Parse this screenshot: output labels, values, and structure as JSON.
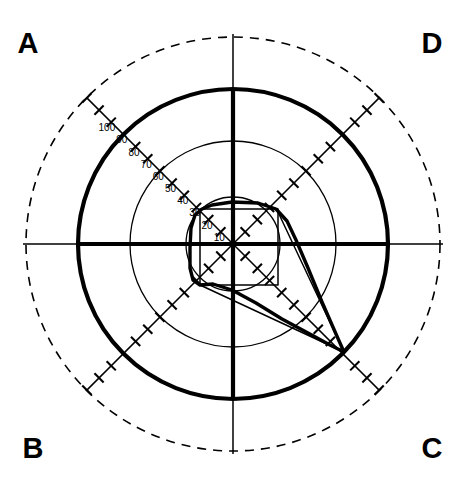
{
  "figure": {
    "type": "goldmann-visual-field-perimetry",
    "background": "#ffffff",
    "ink": "#000000",
    "width": 463,
    "height": 489
  },
  "corner_labels": {
    "top_left": "A",
    "top_right": "D",
    "bottom_left": "B",
    "bottom_right": "C"
  },
  "chart_data": {
    "type": "scatter",
    "title": "",
    "subtitle": "",
    "xlabel": "",
    "ylabel": "",
    "projection": "polar",
    "grid": true,
    "legend_position": "none",
    "center_px": [
      233,
      244
    ],
    "radial_unit": "degrees",
    "degrees_per_pixel": 0.5806,
    "radial_axis": {
      "label": "eccentricity (degrees)",
      "tick_labels": [
        "10",
        "20",
        "30",
        "40",
        "50",
        "60",
        "70",
        "80",
        "90",
        "100"
      ],
      "tick_values": [
        10,
        20,
        30,
        40,
        50,
        60,
        70,
        80,
        90,
        100
      ],
      "tick_label_meridian_deg": 135,
      "tick_spacing_deg": 10,
      "max_tick_deg": 120,
      "rlim": [
        0,
        120
      ]
    },
    "grid_circles": [
      {
        "name": "inner-circle",
        "deg": 27,
        "radius_px": 47,
        "style": "thin-solid",
        "stroke_width": 1.3
      },
      {
        "name": "middle-circle",
        "deg": 60,
        "radius_px": 103,
        "style": "thin-solid",
        "stroke_width": 1.3
      },
      {
        "name": "isopter-boundary-circle",
        "deg": 90,
        "radius_px": 155,
        "style": "thick-solid",
        "stroke_width": 4.2
      },
      {
        "name": "outer-dashed-circle",
        "deg": 120,
        "radius_px": 207,
        "style": "dashed",
        "stroke_width": 1.6
      }
    ],
    "meridians": [
      {
        "name": "horizontal-meridian",
        "angle_deg": 0,
        "style": "axis"
      },
      {
        "name": "vertical-meridian",
        "angle_deg": 90,
        "style": "axis"
      },
      {
        "name": "oblique-meridian-45",
        "angle_deg": 45,
        "style": "ticked"
      },
      {
        "name": "oblique-meridian-135",
        "angle_deg": 135,
        "style": "ticked"
      },
      {
        "name": "oblique-meridian-225",
        "angle_deg": 225,
        "style": "ticked"
      },
      {
        "name": "oblique-meridian-315",
        "angle_deg": 315,
        "style": "ticked"
      }
    ],
    "series": [
      {
        "name": "isopter-trace",
        "style": "thick-solid",
        "stroke_width": 3.4,
        "closed": true,
        "points_px": [
          [
            202,
            209
          ],
          [
            212,
            205
          ],
          [
            232,
            202
          ],
          [
            258,
            203
          ],
          [
            276,
            209
          ],
          [
            287,
            221
          ],
          [
            296,
            240
          ],
          [
            308,
            268
          ],
          [
            322,
            302
          ],
          [
            336,
            334
          ],
          [
            344,
            352
          ],
          [
            330,
            345
          ],
          [
            308,
            333
          ],
          [
            282,
            319
          ],
          [
            256,
            303
          ],
          [
            232,
            290
          ],
          [
            213,
            284
          ],
          [
            200,
            285
          ],
          [
            193,
            280
          ],
          [
            190,
            268
          ],
          [
            190,
            248
          ],
          [
            191,
            228
          ],
          [
            195,
            215
          ]
        ]
      },
      {
        "name": "vector-upper",
        "style": "thin-solid",
        "stroke_width": 1.5,
        "closed": false,
        "points_px": [
          [
            344,
            352
          ],
          [
            278,
            212
          ]
        ]
      },
      {
        "name": "vector-lower",
        "style": "thin-solid",
        "stroke_width": 1.5,
        "closed": false,
        "points_px": [
          [
            344,
            352
          ],
          [
            200,
            285
          ]
        ]
      },
      {
        "name": "scotoma-outline",
        "style": "thin-solid",
        "stroke_width": 1.5,
        "closed": true,
        "points_px": [
          [
            200,
            209
          ],
          [
            278,
            209
          ],
          [
            278,
            285
          ],
          [
            200,
            285
          ]
        ]
      }
    ],
    "annotations": [
      {
        "name": "convergence-point",
        "px": [
          344,
          352
        ],
        "label": ""
      }
    ]
  }
}
